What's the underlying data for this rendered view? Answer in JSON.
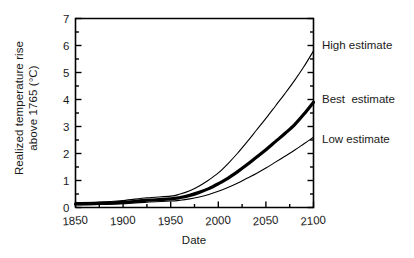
{
  "chart_data": {
    "type": "line",
    "title": "",
    "xlabel": "Date",
    "ylabel_line1": "Realized temperature rise",
    "ylabel_line2": "above 1765 (°C)",
    "ylabel": "Realized temperature rise above 1765 (°C)",
    "xlim": [
      1850,
      2100
    ],
    "ylim": [
      0,
      7
    ],
    "xticks": [
      1850,
      1900,
      1950,
      2000,
      2050,
      2100
    ],
    "xticklabels": [
      "1850",
      "1900",
      "1950",
      "2000",
      "2050",
      "2100"
    ],
    "xminor_step": 25,
    "yticks": [
      0,
      1,
      2,
      3,
      4,
      5,
      6,
      7
    ],
    "yticklabels": [
      "0",
      "1",
      "2",
      "3",
      "4",
      "5",
      "6",
      "7"
    ],
    "yminor_step": 0.5,
    "grid": false,
    "legend_position": "right-inline-annotations",
    "line_color": "#000000",
    "x": [
      1850,
      1875,
      1900,
      1925,
      1950,
      1960,
      1970,
      1980,
      1990,
      2000,
      2010,
      2020,
      2030,
      2040,
      2050,
      2060,
      2070,
      2080,
      2090,
      2100
    ],
    "series": [
      {
        "name": "High estimate",
        "label": "High estimate",
        "linewidth": 1.1,
        "values": [
          0.18,
          0.2,
          0.26,
          0.36,
          0.42,
          0.5,
          0.62,
          0.8,
          1.02,
          1.28,
          1.62,
          2.0,
          2.42,
          2.86,
          3.3,
          3.76,
          4.22,
          4.7,
          5.22,
          5.8
        ]
      },
      {
        "name": "Best estimate",
        "label": "Best  estimate",
        "linewidth": 3.2,
        "values": [
          0.13,
          0.15,
          0.19,
          0.27,
          0.32,
          0.37,
          0.45,
          0.56,
          0.7,
          0.88,
          1.08,
          1.32,
          1.58,
          1.86,
          2.14,
          2.44,
          2.74,
          3.06,
          3.46,
          3.9
        ]
      },
      {
        "name": "Low estimate",
        "label": "Low estimate",
        "linewidth": 1.1,
        "values": [
          0.1,
          0.11,
          0.14,
          0.2,
          0.24,
          0.27,
          0.32,
          0.39,
          0.48,
          0.6,
          0.74,
          0.9,
          1.08,
          1.26,
          1.46,
          1.68,
          1.9,
          2.12,
          2.36,
          2.6
        ]
      }
    ]
  },
  "annotations": {
    "high": "High estimate",
    "best": "Best  estimate",
    "low": "Low estimate"
  }
}
